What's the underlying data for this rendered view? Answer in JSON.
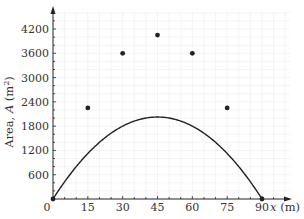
{
  "chart_data": {
    "type": "line",
    "title": "",
    "xlabel": "x (m)",
    "ylabel": "Area, A (m²)",
    "x": [
      0,
      15,
      30,
      45,
      60,
      75,
      90
    ],
    "series": [
      {
        "name": "A",
        "values": [
          0,
          2250,
          3600,
          4050,
          3600,
          2250,
          0
        ]
      }
    ],
    "xticks": [
      0,
      15,
      30,
      45,
      60,
      75,
      90
    ],
    "yticks": [
      600,
      1200,
      1800,
      2400,
      3000,
      3600,
      4200
    ],
    "xlim": [
      0,
      95
    ],
    "ylim": [
      0,
      4500
    ],
    "grid": true,
    "curve_color": "#222222",
    "grid_color": "#ececec"
  },
  "labels": {
    "origin": "0",
    "x_axis": "x (m)",
    "y_axis_prefix": "Area, ",
    "y_axis_var": "A",
    "y_axis_unit": " (m",
    "y_axis_sup": "2",
    "y_axis_close": ")"
  }
}
